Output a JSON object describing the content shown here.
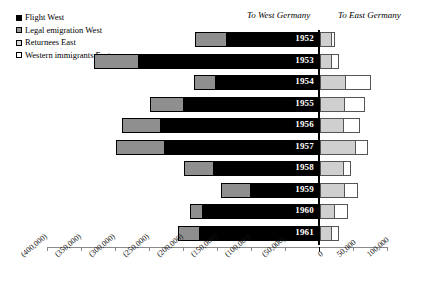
{
  "legend": {
    "items": [
      {
        "label": "Flight West",
        "color": "#000000",
        "key": "flight_west"
      },
      {
        "label": "Legal emigration West",
        "color": "#8f8f8f",
        "key": "legal_emigration_west"
      },
      {
        "label": "Returnees East",
        "color": "#cfcfcf",
        "key": "returnees_east"
      },
      {
        "label": "Western immigrants East",
        "color": "#ffffff",
        "key": "western_immigrants_east"
      }
    ]
  },
  "captions": {
    "west": "To West Germany",
    "east": "To East Germany"
  },
  "axis": {
    "ticks": [
      {
        "label": "(400,000)",
        "value": -400000
      },
      {
        "label": "(350,000)",
        "value": -350000
      },
      {
        "label": "(300,000)",
        "value": -300000
      },
      {
        "label": "(250,000)",
        "value": -250000
      },
      {
        "label": "(200,000)",
        "value": -200000
      },
      {
        "label": "(150,000)",
        "value": -150000
      },
      {
        "label": "(100,000)",
        "value": -100000
      },
      {
        "label": "(50,000)",
        "value": -50000
      },
      {
        "label": "0",
        "value": 0
      },
      {
        "label": "50,000",
        "value": 50000
      },
      {
        "label": "100,000",
        "value": 100000
      }
    ]
  },
  "chart_data": {
    "type": "bar",
    "orientation": "horizontal",
    "stacked": true,
    "title": "",
    "subtitle": "",
    "xlabel": "",
    "ylabel": "",
    "xlim": [
      -400000,
      100000
    ],
    "grid": false,
    "legend_position": "top-left",
    "categories": [
      "1952",
      "1953",
      "1954",
      "1955",
      "1956",
      "1957",
      "1958",
      "1959",
      "1960",
      "1961"
    ],
    "series": [
      {
        "name": "Flight West",
        "direction": "negative",
        "color": "#000000",
        "values": [
          -136000,
          -265000,
          -152000,
          -198000,
          -233000,
          -226000,
          -155000,
          -100000,
          -170000,
          -175000
        ]
      },
      {
        "name": "Legal emigration West",
        "direction": "negative",
        "color": "#8f8f8f",
        "values": [
          -46000,
          -66000,
          -32000,
          -50000,
          -57000,
          -72000,
          -43000,
          -44000,
          -20000,
          -32000
        ]
      },
      {
        "name": "Returnees East",
        "direction": "positive",
        "color": "#cfcfcf",
        "values": [
          17000,
          17000,
          38000,
          37000,
          35000,
          53000,
          35000,
          37000,
          22000,
          17000
        ]
      },
      {
        "name": "Western immigrants East",
        "direction": "positive",
        "color": "#ffffff",
        "values": [
          7000,
          13000,
          38000,
          30000,
          25000,
          19000,
          12000,
          20000,
          20000,
          12000
        ]
      }
    ],
    "annotations": [
      "To West Germany",
      "To East Germany"
    ]
  },
  "rows": [
    {
      "year": "1952",
      "flight": -136000,
      "legal": -46000,
      "returnees": 17000,
      "immigrants": 7000
    },
    {
      "year": "1953",
      "flight": -265000,
      "legal": -66000,
      "returnees": 17000,
      "immigrants": 13000
    },
    {
      "year": "1954",
      "flight": -152000,
      "legal": -32000,
      "returnees": 38000,
      "immigrants": 38000
    },
    {
      "year": "1955",
      "flight": -198000,
      "legal": -50000,
      "returnees": 37000,
      "immigrants": 30000
    },
    {
      "year": "1956",
      "flight": -233000,
      "legal": -57000,
      "returnees": 35000,
      "immigrants": 25000
    },
    {
      "year": "1957",
      "flight": -226000,
      "legal": -72000,
      "returnees": 53000,
      "immigrants": 19000
    },
    {
      "year": "1958",
      "flight": -155000,
      "legal": -43000,
      "returnees": 35000,
      "immigrants": 12000
    },
    {
      "year": "1959",
      "flight": -100000,
      "legal": -44000,
      "returnees": 37000,
      "immigrants": 20000
    },
    {
      "year": "1960",
      "flight": -170000,
      "legal": -20000,
      "returnees": 22000,
      "immigrants": 20000
    },
    {
      "year": "1961",
      "flight": -175000,
      "legal": -32000,
      "returnees": 17000,
      "immigrants": 12000
    }
  ]
}
